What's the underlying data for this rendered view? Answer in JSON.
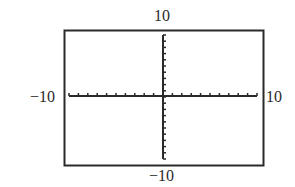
{
  "chart_data": {
    "type": "line",
    "title": "",
    "xlabel": "",
    "ylabel": "",
    "xlim": [
      -10,
      10
    ],
    "ylim": [
      -10,
      10
    ],
    "xscale": 1,
    "yscale": 1,
    "grid": false,
    "legend": null,
    "series": [],
    "tick_labels": {
      "x_min": "−10",
      "x_max": "10",
      "y_min": "−10",
      "y_max": "10"
    }
  },
  "window": {
    "border_color": "#2a2a2a",
    "axis_color": "#2a2a2a",
    "background": "#ffffff"
  }
}
